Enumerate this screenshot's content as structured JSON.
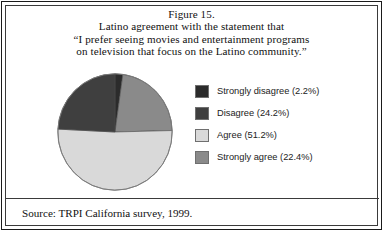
{
  "figure": {
    "number_label": "Figure 15.",
    "title_lines": [
      "Figure 15.",
      "Latino agreement with the statement that",
      "“I prefer seeing movies and entertainment programs",
      "on television that focus on the Latino community.”"
    ],
    "source": "Source: TRPI California survey, 1999."
  },
  "chart_data": {
    "type": "pie",
    "title": "Latino agreement with the statement that “I prefer seeing movies and entertainment programs on television that focus on the Latino community.”",
    "xlabel": "",
    "ylabel": "",
    "categories": [
      "Strongly disagree",
      "Disagree",
      "Agree",
      "Strongly agree"
    ],
    "values": [
      2.2,
      24.2,
      51.2,
      22.4
    ],
    "unit": "percent",
    "start_angle_deg": 0,
    "direction": "clockwise",
    "slice_order_clockwise": [
      "Strongly disagree",
      "Strongly agree",
      "Agree",
      "Disagree"
    ],
    "colors": [
      "#2b2b2b",
      "#3f3f3f",
      "#d9d9d9",
      "#8a8a8a"
    ],
    "legend_position": "right",
    "grid": false,
    "legend": [
      {
        "label": "Strongly disagree (2.2%)",
        "name": "Strongly disagree",
        "value": 2.2,
        "color": "#2b2b2b"
      },
      {
        "label": "Disagree (24.2%)",
        "name": "Disagree",
        "value": 24.2,
        "color": "#3f3f3f"
      },
      {
        "label": "Agree (51.2%)",
        "name": "Agree",
        "value": 51.2,
        "color": "#d9d9d9"
      },
      {
        "label": "Strongly agree (22.4%)",
        "name": "Strongly agree",
        "value": 22.4,
        "color": "#8a8a8a"
      }
    ]
  }
}
